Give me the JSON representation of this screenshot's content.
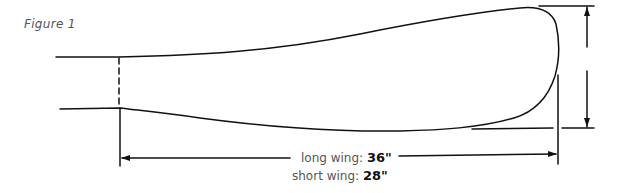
{
  "figure": {
    "label": "Figure 1"
  },
  "dimensions": {
    "long_wing": {
      "label": "long wing: ",
      "value": "36\""
    },
    "short_wing": {
      "label": "short wing: ",
      "value": "28\""
    }
  },
  "colors": {
    "line": "#111111",
    "label_text": "#555555",
    "value_text": "#111111"
  }
}
